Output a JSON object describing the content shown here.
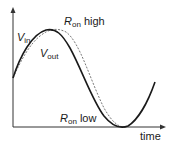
{
  "labels": {
    "vin_main": "V",
    "vin_sub": "in",
    "vout_main": "V",
    "vout_sub": "out",
    "ron_high_main": "R",
    "ron_high_sub": "on",
    "ron_high_suffix": "high",
    "ron_low_main": "R",
    "ron_low_sub": "on",
    "ron_low_suffix": "low",
    "x_axis": "time"
  },
  "colors": {
    "curve": "#1a1a1a",
    "dashed": "#555555",
    "axis": "#333333"
  }
}
